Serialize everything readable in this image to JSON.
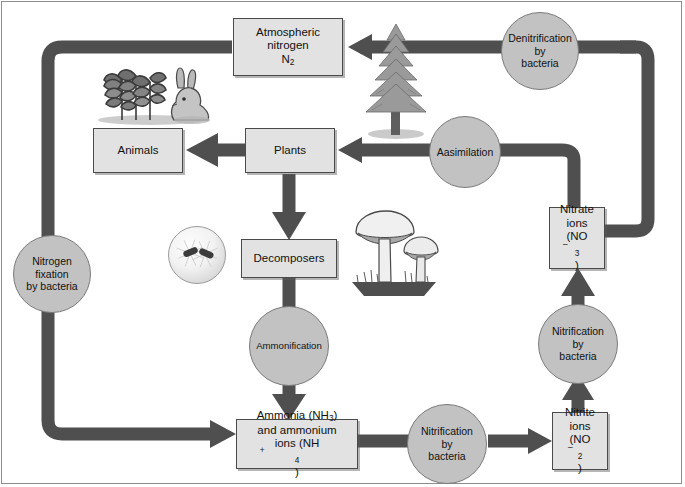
{
  "figure": {
    "palette": {
      "arrow": "#4f4f4f",
      "box_fill": "#e2e2e2",
      "box_stroke": "#4a4a4a",
      "circle_fill": "#c2c2c2",
      "circle_stroke": "#7a7a7a",
      "text": "#111111",
      "frame": "#8d8d8d",
      "background": "#ffffff"
    }
  },
  "boxes": {
    "atmospheric_nitrogen": {
      "line1": "Atmospheric",
      "line2": "nitrogen",
      "formula_symbol": "N",
      "formula_sub": "2"
    },
    "animals": {
      "label": "Animals"
    },
    "plants": {
      "label": "Plants"
    },
    "decomposers": {
      "label": "Decomposers"
    },
    "ammonia": {
      "line1_text": "Ammonia (NH",
      "line1_sub": "3",
      "line1_tail": ")",
      "line2": "and ammonium",
      "line3_text": "ions (NH",
      "line3_sub": "4",
      "line3_sup": "+",
      "line3_tail": ")"
    },
    "nitrite_ions": {
      "line1": "Nitrite",
      "line2": "ions",
      "formula_open": "(NO",
      "formula_sub": "2",
      "formula_charge": "–",
      "formula_close": ")"
    },
    "nitrate_ions": {
      "line1": "Nitrate",
      "line2": "ions",
      "formula_open": "(NO",
      "formula_sub": "3",
      "formula_charge": "–",
      "formula_close": ")"
    }
  },
  "circles": {
    "denitrification": {
      "line1": "Denitrification",
      "line2": "by",
      "line3": "bacteria"
    },
    "assimilation": {
      "line1": "Aasimilation"
    },
    "nitrogen_fixation": {
      "line1": "Nitrogen",
      "line2": "fixation",
      "line3": "by bacteria"
    },
    "ammonification": {
      "line1": "Ammonification"
    },
    "nitrification_bottom": {
      "line1": "Nitrification",
      "line2": "by",
      "line3": "bacteria"
    },
    "nitrification_right": {
      "line1": "Nitrification",
      "line2": "by",
      "line3": "bacteria"
    }
  },
  "illustrations": {
    "plants_and_rabbit": "plants-and-rabbit-illustration",
    "conifer_tree": "conifer-tree-illustration",
    "bacteria_micrograph": "bacteria-micrograph-illustration",
    "mushrooms": "mushrooms-illustration"
  },
  "arrow_flows": [
    {
      "name": "denitrification-to-atmosphere",
      "from": "nitrate-ions",
      "to": "atmospheric-nitrogen",
      "via": "denitrification-by-bacteria"
    },
    {
      "name": "atmosphere-to-nitrogen-fixation",
      "from": "atmospheric-nitrogen",
      "to": "ammonia",
      "via": "nitrogen-fixation-by-bacteria"
    },
    {
      "name": "assimilation-to-plants",
      "from": "nitrate-ions",
      "to": "plants",
      "via": "aasimilation"
    },
    {
      "name": "plants-to-animals",
      "from": "plants",
      "to": "animals"
    },
    {
      "name": "plants-to-decomposers",
      "from": "plants",
      "to": "decomposers"
    },
    {
      "name": "decomposers-to-ammonia",
      "from": "decomposers",
      "to": "ammonia",
      "via": "ammonification"
    },
    {
      "name": "ammonia-to-nitrite",
      "from": "ammonia",
      "to": "nitrite-ions",
      "via": "nitrification-by-bacteria"
    },
    {
      "name": "nitrite-to-nitrate",
      "from": "nitrite-ions",
      "to": "nitrate-ions",
      "via": "nitrification-by-bacteria"
    }
  ]
}
